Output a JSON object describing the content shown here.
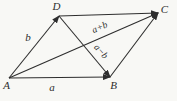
{
  "background_color": "#f8f8f5",
  "line_color": "#2e2e2e",
  "text_color": "#2e2e2e",
  "chart_data": {
    "type": "diagram",
    "subtype": "vector-parallelogram",
    "width": 177,
    "height": 101,
    "vertices": {
      "A": {
        "x": 9,
        "y": 78,
        "label": "A",
        "label_x": 6.5,
        "label_y": 86
      },
      "B": {
        "x": 110,
        "y": 77,
        "label": "B",
        "label_x": 113.5,
        "label_y": 86
      },
      "C": {
        "x": 158,
        "y": 13,
        "label": "C",
        "label_x": 164.5,
        "label_y": 10
      },
      "D": {
        "x": 59,
        "y": 16,
        "label": "D",
        "label_x": 56.5,
        "label_y": 7.5
      }
    },
    "edges": [
      {
        "from": "A",
        "to": "B",
        "arrow": true,
        "meaning": "vector a (bottom side)"
      },
      {
        "from": "D",
        "to": "C",
        "arrow": true,
        "meaning": "vector a (top side)"
      },
      {
        "from": "A",
        "to": "D",
        "arrow": true,
        "meaning": "vector b (left side)"
      },
      {
        "from": "B",
        "to": "C",
        "arrow": true,
        "meaning": "vector b (right side)"
      },
      {
        "from": "A",
        "to": "C",
        "arrow": true,
        "meaning": "diagonal a+b"
      },
      {
        "from": "D",
        "to": "B",
        "arrow": true,
        "meaning": "diagonal a−b"
      }
    ],
    "labels": [
      {
        "id": "label-a",
        "text": "a",
        "x": 52,
        "y": 88,
        "rotate": 0,
        "font_size": 11
      },
      {
        "id": "label-b",
        "text": "b",
        "x": 28,
        "y": 38.5,
        "rotate": 0,
        "font_size": 11
      },
      {
        "id": "label-a-plus-b",
        "text": "a+b",
        "x": 100,
        "y": 28,
        "rotate": -23,
        "font_size": 9.5
      },
      {
        "id": "label-a-minus-b",
        "text": "a−b",
        "x": 100.5,
        "y": 52,
        "rotate": 48,
        "font_size": 9.5
      }
    ]
  }
}
